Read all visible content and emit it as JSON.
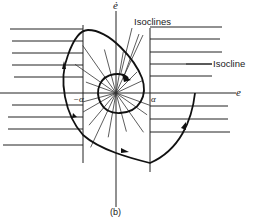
{
  "figure": {
    "caption": "(b)",
    "axes": {
      "vertical_label": "ė",
      "horizontal_label": "e"
    },
    "annotations": {
      "isoclines_label": "Isoclines",
      "isocline_label": "Isocline",
      "neg_alpha_label": "−α",
      "pos_alpha_label": "α"
    },
    "colors": {
      "ink": "#111111",
      "background": "#ffffff"
    }
  }
}
